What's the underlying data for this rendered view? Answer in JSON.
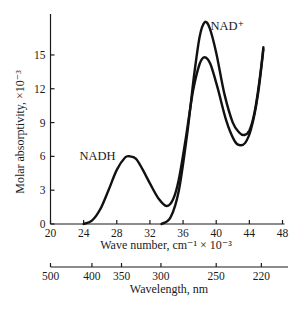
{
  "chart_data": {
    "type": "line",
    "title": "",
    "xlabel": "Wave number, cm⁻¹ × 10⁻³",
    "ylabel": "Molar absorptivity, ×10⁻³",
    "secondary_xlabel": "Wavelength, nm",
    "xlim": [
      20,
      48
    ],
    "ylim": [
      0,
      18
    ],
    "x_ticks": [
      20,
      24,
      28,
      32,
      36,
      40,
      44,
      48
    ],
    "y_ticks": [
      0,
      3,
      6,
      9,
      12,
      15
    ],
    "secondary_x_ticks": [
      {
        "label": "500",
        "wavenumber": 20.0
      },
      {
        "label": "400",
        "wavenumber": 25.0
      },
      {
        "label": "350",
        "wavenumber": 28.57
      },
      {
        "label": "300",
        "wavenumber": 33.33
      },
      {
        "label": "250",
        "wavenumber": 40.0
      },
      {
        "label": "220",
        "wavenumber": 45.45
      }
    ],
    "grid": false,
    "legend": "inline labels",
    "series": [
      {
        "name": "NAD⁺",
        "label_at": [
          39.3,
          17.6
        ],
        "x": [
          33.4,
          34.5,
          35.5,
          36.5,
          37.3,
          38.0,
          38.6,
          39.2,
          40.0,
          41.0,
          42.0,
          42.8,
          43.4,
          44.0,
          44.6,
          45.2,
          45.7
        ],
        "y": [
          0,
          0.6,
          3.0,
          8.0,
          13.0,
          16.6,
          17.9,
          17.4,
          15.2,
          11.5,
          9.0,
          8.1,
          7.9,
          8.3,
          9.8,
          12.6,
          15.7
        ]
      },
      {
        "name": "NADH",
        "label_at": [
          23.5,
          6.0
        ],
        "x": [
          24.0,
          25.0,
          26.0,
          27.0,
          28.0,
          29.0,
          29.6,
          30.3,
          31.0,
          32.0,
          33.0,
          34.0,
          34.8,
          35.5,
          36.3,
          37.2,
          38.0,
          38.6,
          39.3,
          40.2,
          41.2,
          42.2,
          42.8,
          43.5,
          44.2,
          45.0,
          45.7
        ],
        "y": [
          0,
          0.3,
          1.3,
          3.0,
          4.8,
          5.9,
          6.0,
          5.8,
          5.0,
          3.6,
          2.3,
          1.6,
          2.2,
          4.0,
          7.5,
          11.8,
          14.2,
          14.8,
          14.2,
          12.0,
          9.2,
          7.4,
          7.0,
          7.2,
          8.4,
          11.3,
          15.5
        ]
      }
    ]
  }
}
